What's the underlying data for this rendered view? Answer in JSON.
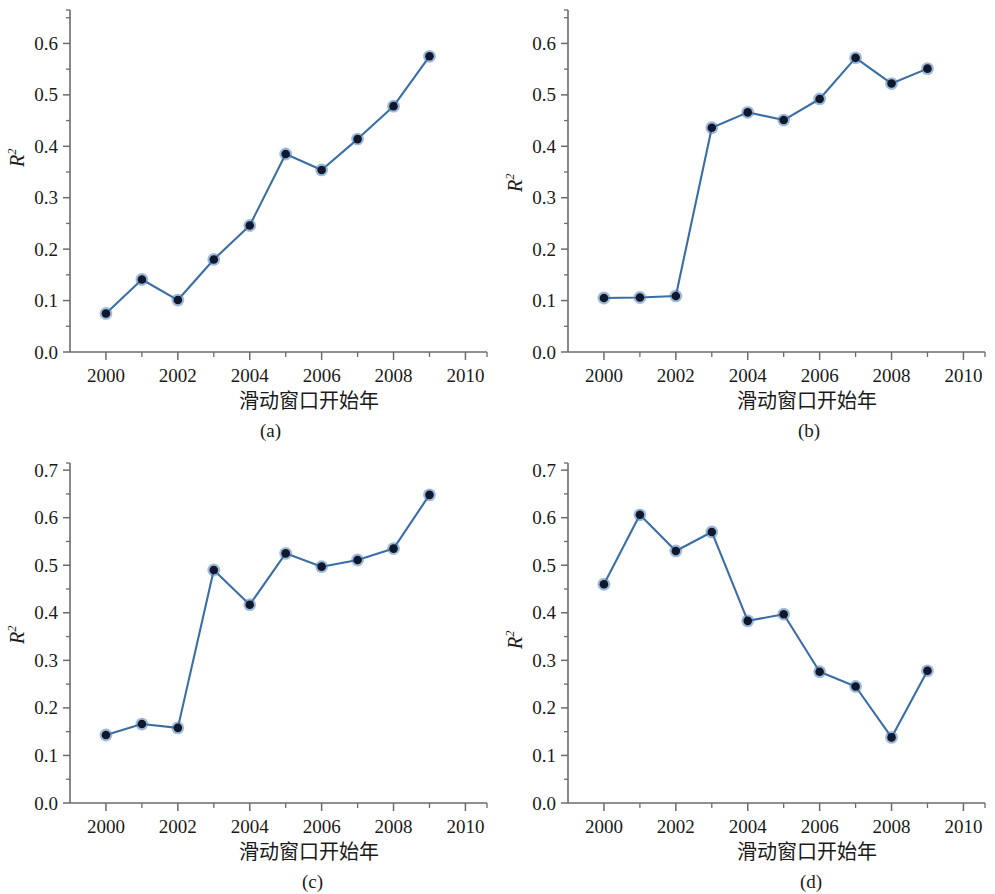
{
  "figure": {
    "width": 995,
    "height": 894,
    "background": "#ffffff",
    "line_color": "#3a6ea5",
    "marker_fill": "#11182b",
    "marker_halo": "#4e82bd",
    "axis_color": "#6b6b6b",
    "text_color": "#1a1a1a"
  },
  "common": {
    "xlabel": "滑动窗口开始年",
    "ylabel_base": "R",
    "ylabel_exp": "2",
    "x_ticks": [
      "2000",
      "2002",
      "2004",
      "2006",
      "2008",
      "2010"
    ],
    "x_tick_values": [
      2000,
      2002,
      2004,
      2006,
      2008,
      2010
    ],
    "x_minor_values": [
      2001,
      2003,
      2005,
      2007,
      2009
    ],
    "xlim": [
      1999,
      2010.6
    ]
  },
  "panels": [
    {
      "key": "a",
      "caption": "(a)",
      "y_ticks": [
        "0.0",
        "0.1",
        "0.2",
        "0.3",
        "0.4",
        "0.5",
        "0.6"
      ],
      "y_tick_values": [
        0.0,
        0.1,
        0.2,
        0.3,
        0.4,
        0.5,
        0.6
      ],
      "y_minor_values": [
        0.05,
        0.15,
        0.25,
        0.35,
        0.45,
        0.55,
        0.65
      ],
      "ylim": [
        0.0,
        0.665
      ]
    },
    {
      "key": "b",
      "caption": "(b)",
      "y_ticks": [
        "0.0",
        "0.1",
        "0.2",
        "0.3",
        "0.4",
        "0.5",
        "0.6"
      ],
      "y_tick_values": [
        0.0,
        0.1,
        0.2,
        0.3,
        0.4,
        0.5,
        0.6
      ],
      "y_minor_values": [
        0.05,
        0.15,
        0.25,
        0.35,
        0.45,
        0.55,
        0.65
      ],
      "ylim": [
        0.0,
        0.665
      ]
    },
    {
      "key": "c",
      "caption": "(c)",
      "y_ticks": [
        "0.0",
        "0.1",
        "0.2",
        "0.3",
        "0.4",
        "0.5",
        "0.6",
        "0.7"
      ],
      "y_tick_values": [
        0.0,
        0.1,
        0.2,
        0.3,
        0.4,
        0.5,
        0.6,
        0.7
      ],
      "y_minor_values": [
        0.05,
        0.15,
        0.25,
        0.35,
        0.45,
        0.55,
        0.65
      ],
      "ylim": [
        0.0,
        0.715
      ]
    },
    {
      "key": "d",
      "caption": "(d)",
      "y_ticks": [
        "0.0",
        "0.1",
        "0.2",
        "0.3",
        "0.4",
        "0.5",
        "0.6",
        "0.7"
      ],
      "y_tick_values": [
        0.0,
        0.1,
        0.2,
        0.3,
        0.4,
        0.5,
        0.6,
        0.7
      ],
      "y_minor_values": [
        0.05,
        0.15,
        0.25,
        0.35,
        0.45,
        0.55,
        0.65
      ],
      "ylim": [
        0.0,
        0.715
      ]
    }
  ],
  "chart_data": [
    {
      "type": "line",
      "panel": "a",
      "title": "(a)",
      "xlabel": "滑动窗口开始年",
      "ylabel": "R^2",
      "x": [
        2000,
        2001,
        2002,
        2003,
        2004,
        2005,
        2006,
        2007,
        2008,
        2009
      ],
      "values": [
        0.075,
        0.141,
        0.101,
        0.18,
        0.246,
        0.385,
        0.354,
        0.414,
        0.478,
        0.575
      ],
      "xlim": [
        1999,
        2010.6
      ],
      "ylim": [
        0.0,
        0.665
      ],
      "grid": false,
      "legend": "none",
      "marker": "filled-circle"
    },
    {
      "type": "line",
      "panel": "b",
      "title": "(b)",
      "xlabel": "滑动窗口开始年",
      "ylabel": "R^2",
      "x": [
        2000,
        2001,
        2002,
        2003,
        2004,
        2005,
        2006,
        2007,
        2008,
        2009
      ],
      "values": [
        0.105,
        0.106,
        0.109,
        0.436,
        0.466,
        0.451,
        0.492,
        0.572,
        0.522,
        0.551
      ],
      "xlim": [
        1999,
        2010.6
      ],
      "ylim": [
        0.0,
        0.665
      ],
      "grid": false,
      "legend": "none",
      "marker": "filled-circle"
    },
    {
      "type": "line",
      "panel": "c",
      "title": "(c)",
      "xlabel": "滑动窗口开始年",
      "ylabel": "R^2",
      "x": [
        2000,
        2001,
        2002,
        2003,
        2004,
        2005,
        2006,
        2007,
        2008,
        2009
      ],
      "values": [
        0.143,
        0.166,
        0.158,
        0.49,
        0.417,
        0.525,
        0.497,
        0.511,
        0.535,
        0.648
      ],
      "xlim": [
        1999,
        2010.6
      ],
      "ylim": [
        0.0,
        0.715
      ],
      "grid": false,
      "legend": "none",
      "marker": "filled-circle"
    },
    {
      "type": "line",
      "panel": "d",
      "title": "(d)",
      "xlabel": "滑动窗口开始年",
      "ylabel": "R^2",
      "x": [
        2000,
        2001,
        2002,
        2003,
        2004,
        2005,
        2006,
        2007,
        2008,
        2009
      ],
      "values": [
        0.46,
        0.606,
        0.53,
        0.57,
        0.383,
        0.397,
        0.276,
        0.245,
        0.138,
        0.278
      ],
      "xlim": [
        1999,
        2010.6
      ],
      "ylim": [
        0.0,
        0.715
      ],
      "grid": false,
      "legend": "none",
      "marker": "filled-circle"
    }
  ]
}
